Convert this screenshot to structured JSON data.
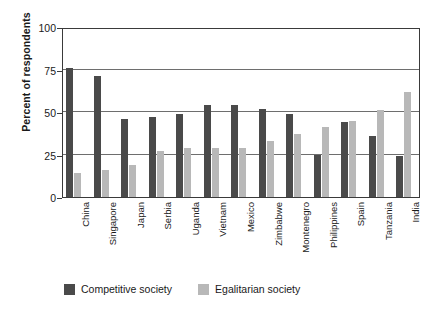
{
  "chart_data": {
    "type": "bar",
    "title": "",
    "subtitle": "",
    "xlabel": "",
    "ylabel": "Percent of respondents",
    "ylim": [
      0,
      100
    ],
    "yticks": [
      0,
      25,
      50,
      75,
      100
    ],
    "ytick_labels": [
      "0",
      "25",
      "50",
      "75",
      "100"
    ],
    "grid": "horizontal",
    "legend_position": "bottom",
    "categories": [
      "China",
      "Singapore",
      "Japan",
      "Serbia",
      "Uganda",
      "Vietnam",
      "Mexico",
      "Zimbabwe",
      "Montenegro",
      "Philippines",
      "Spain",
      "Tanzania",
      "India"
    ],
    "series": [
      {
        "name": "Competitive society",
        "color": "#4a4a4a",
        "values": [
          76,
          71,
          46,
          47,
          49,
          54,
          54,
          52,
          49,
          25,
          44,
          36,
          24
        ]
      },
      {
        "name": "Egalitarian society",
        "color": "#b8b8b8",
        "values": [
          14,
          16,
          19,
          27,
          29,
          29,
          29,
          33,
          37,
          41,
          45,
          51,
          62
        ]
      }
    ]
  },
  "legend": {
    "items": [
      {
        "label": "Competitive society",
        "color": "#4a4a4a"
      },
      {
        "label": "Egalitarian society",
        "color": "#b8b8b8"
      }
    ]
  },
  "axis": {
    "y_title": "Percent of respondents"
  }
}
